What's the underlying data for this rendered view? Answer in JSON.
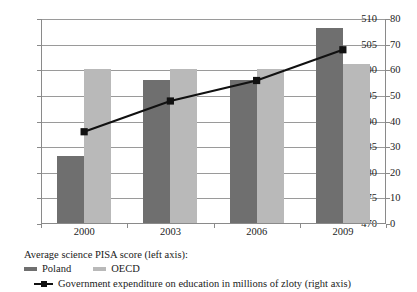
{
  "chart_data": {
    "type": "bar",
    "title": "",
    "xlabel": "",
    "categories": [
      "2000",
      "2003",
      "2006",
      "2009"
    ],
    "series": [
      {
        "name": "Poland",
        "type": "bar",
        "axis": "left",
        "color": "#6f6f6f",
        "values": [
          483,
          498,
          498,
          508
        ]
      },
      {
        "name": "OECD",
        "type": "bar",
        "axis": "left",
        "color": "#b9b9b9",
        "values": [
          500,
          500,
          500,
          501
        ]
      },
      {
        "name": "Government expenditure on education in millions of zloty (right axis)",
        "type": "line",
        "axis": "right",
        "color": "#111111",
        "marker": "square",
        "values": [
          36,
          48,
          56,
          68
        ]
      }
    ],
    "left_axis": {
      "label": "Average science PISA score (left axis)",
      "ylim": [
        470,
        510
      ],
      "tick_step": 5,
      "ticks": [
        "510",
        "505",
        "500",
        "495",
        "490",
        "485",
        "480",
        "475",
        "470"
      ]
    },
    "right_axis": {
      "label": "Government expenditure on education in millions of zloty (right axis)",
      "ylim": [
        0,
        80
      ],
      "tick_step": 10,
      "ticks": [
        "80",
        "70",
        "60",
        "50",
        "40",
        "30",
        "20",
        "10",
        "0"
      ]
    },
    "grid": true,
    "legend_position": "bottom-left"
  },
  "legend": {
    "title": "Average science PISA score (left axis):",
    "bar_entries": [
      {
        "label": "Poland"
      },
      {
        "label": "OECD"
      }
    ],
    "line_entry": {
      "label": "Government expenditure on education in millions of zloty (right axis)"
    }
  }
}
